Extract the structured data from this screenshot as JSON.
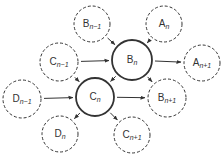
{
  "diagram": {
    "title": "",
    "colors": {
      "stroke": "#333333",
      "background": "#ffffff"
    },
    "nodes": [
      {
        "id": "B_n-1",
        "letter": "B",
        "sub": "n−1",
        "cx": 92,
        "cy": 24,
        "r": 18,
        "style": "dashed"
      },
      {
        "id": "A_n",
        "letter": "A",
        "sub": "n",
        "cx": 164,
        "cy": 24,
        "r": 18,
        "style": "dashed"
      },
      {
        "id": "C_n-1",
        "letter": "C",
        "sub": "n−1",
        "cx": 59,
        "cy": 62,
        "r": 19,
        "style": "dashed"
      },
      {
        "id": "B_n",
        "letter": "B",
        "sub": "n",
        "cx": 132,
        "cy": 60,
        "r": 20,
        "style": "solid"
      },
      {
        "id": "A_n+1",
        "letter": "A",
        "sub": "n+1",
        "cx": 202,
        "cy": 63,
        "r": 18,
        "style": "dashed"
      },
      {
        "id": "D_n-1",
        "letter": "D",
        "sub": "n−1",
        "cx": 22,
        "cy": 99,
        "r": 19,
        "style": "dashed"
      },
      {
        "id": "C_n",
        "letter": "C",
        "sub": "n",
        "cx": 95,
        "cy": 97,
        "r": 19,
        "style": "solid"
      },
      {
        "id": "B_n+1",
        "letter": "B",
        "sub": "n+1",
        "cx": 167,
        "cy": 98,
        "r": 19,
        "style": "dashed"
      },
      {
        "id": "D_n",
        "letter": "D",
        "sub": "n",
        "cx": 60,
        "cy": 134,
        "r": 18,
        "style": "dashed"
      },
      {
        "id": "C_n+1",
        "letter": "C",
        "sub": "n+1",
        "cx": 132,
        "cy": 135,
        "r": 18,
        "style": "dashed"
      }
    ],
    "edges": [
      {
        "from": "B_n-1",
        "to": "B_n"
      },
      {
        "from": "A_n",
        "to": "B_n"
      },
      {
        "from": "C_n-1",
        "to": "B_n"
      },
      {
        "from": "C_n-1",
        "to": "C_n"
      },
      {
        "from": "B_n",
        "to": "C_n"
      },
      {
        "from": "B_n",
        "to": "A_n+1"
      },
      {
        "from": "B_n",
        "to": "B_n+1"
      },
      {
        "from": "D_n-1",
        "to": "C_n"
      },
      {
        "from": "C_n",
        "to": "B_n+1"
      },
      {
        "from": "C_n",
        "to": "D_n"
      },
      {
        "from": "C_n",
        "to": "C_n+1"
      }
    ]
  }
}
